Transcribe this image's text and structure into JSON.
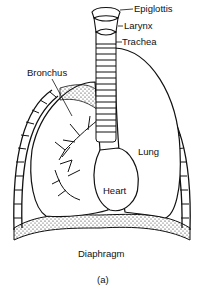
{
  "figure": {
    "caption": "(a)",
    "labels": {
      "epiglottis": "Epiglottis",
      "larynx": "Larynx",
      "trachea": "Trachea",
      "bronchus": "Bronchus",
      "lung": "Lung",
      "heart": "Heart",
      "diaphragm": "Diaphragm"
    },
    "colors": {
      "ink": "#111111",
      "background": "#ffffff"
    }
  }
}
